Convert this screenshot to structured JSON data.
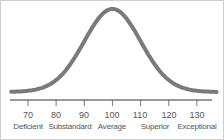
{
  "chart_data": {
    "type": "line",
    "title": "",
    "xlabel": "",
    "ylabel": "",
    "x_ticks": [
      70,
      80,
      90,
      100,
      110,
      120,
      130
    ],
    "x_tick_labels": [
      "70",
      "80",
      "90",
      "100",
      "110",
      "120",
      "130"
    ],
    "categories": [
      {
        "label": "Deficient",
        "at": 70
      },
      {
        "label": "Substandard",
        "at": 80
      },
      {
        "label": "Average",
        "at": 100
      },
      {
        "label": "Superior",
        "at": 110
      },
      {
        "label": "Exceptional",
        "at": 130
      }
    ],
    "series": [
      {
        "name": "distribution",
        "mean": 100,
        "sd": 10,
        "color": "#7a7a7a"
      }
    ],
    "xlim": [
      64,
      137
    ],
    "grid": false,
    "legend": "none"
  },
  "axis": {
    "ticks": [
      "70",
      "80",
      "90",
      "100",
      "110",
      "120",
      "130"
    ],
    "labels": {
      "deficient": "Deficient",
      "substandard": "Substandard",
      "average": "Average",
      "superior": "Superior",
      "exceptional": "Exceptional"
    }
  },
  "colors": {
    "curve": "#7a7a7a",
    "axis": "#333333",
    "text": "#555555",
    "frame": "#cfcfcf"
  }
}
